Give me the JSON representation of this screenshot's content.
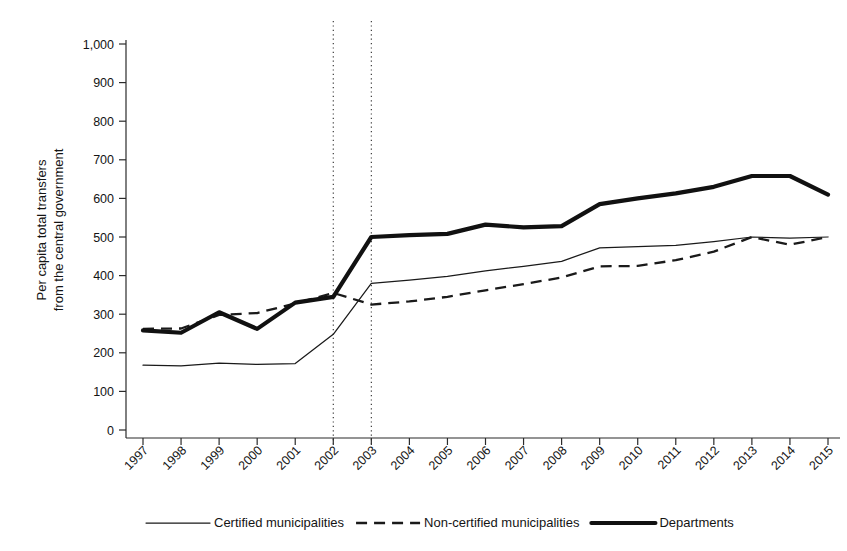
{
  "chart_data": {
    "type": "line",
    "title": "",
    "xlabel": "",
    "ylabel": "Per capita total transfers from the central government",
    "ylabel_line1": "Per capita total transfers",
    "ylabel_line2": "from the central government",
    "categories": [
      "1997",
      "1998",
      "1999",
      "2000",
      "2001",
      "2002",
      "2003",
      "2004",
      "2005",
      "2006",
      "2007",
      "2008",
      "2009",
      "2010",
      "2011",
      "2012",
      "2013",
      "2014",
      "2015"
    ],
    "x": [
      1997,
      1998,
      1999,
      2000,
      2001,
      2002,
      2003,
      2004,
      2005,
      2006,
      2007,
      2008,
      2009,
      2010,
      2011,
      2012,
      2013,
      2014,
      2015
    ],
    "ylim": [
      0,
      1000
    ],
    "ytick_labels": [
      "0",
      "100",
      "200",
      "300",
      "400",
      "500",
      "600",
      "700",
      "800",
      "900",
      "1,000"
    ],
    "ytick_values": [
      0,
      100,
      200,
      300,
      400,
      500,
      600,
      700,
      800,
      900,
      1000
    ],
    "grid": false,
    "legend_position": "bottom",
    "annotations": [
      {
        "type": "vertical-dotted-line",
        "x": 2002,
        "label": "2002"
      },
      {
        "type": "vertical-dotted-line",
        "x": 2003,
        "label": "2003"
      }
    ],
    "series": [
      {
        "name": "Certified municipalities",
        "style": "solid-thin",
        "values": [
          168,
          166,
          173,
          170,
          172,
          248,
          380,
          388,
          398,
          412,
          424,
          437,
          472,
          475,
          478,
          488,
          500,
          497,
          500
        ]
      },
      {
        "name": "Non-certified municipalities",
        "style": "dashed",
        "values": [
          262,
          263,
          298,
          303,
          328,
          355,
          325,
          333,
          345,
          362,
          378,
          395,
          424,
          425,
          440,
          462,
          500,
          480,
          500
        ]
      },
      {
        "name": "Departments",
        "style": "solid-thick",
        "values": [
          258,
          252,
          305,
          262,
          330,
          345,
          500,
          505,
          508,
          532,
          525,
          528,
          585,
          600,
          613,
          630,
          658,
          658,
          610
        ]
      }
    ]
  },
  "legend": {
    "items": [
      {
        "label": "Certified municipalities",
        "style": "solid-thin"
      },
      {
        "label": "Non-certified municipalities",
        "style": "dashed"
      },
      {
        "label": "Departments",
        "style": "solid-thick"
      }
    ]
  }
}
